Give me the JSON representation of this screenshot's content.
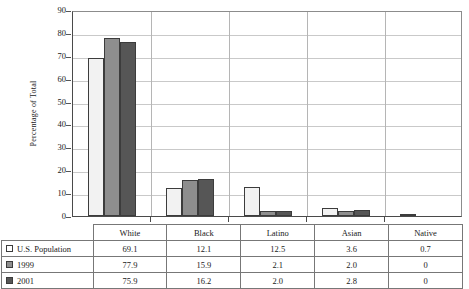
{
  "chart_data": {
    "type": "bar",
    "title": "",
    "xlabel": "",
    "ylabel": "Percentage of Total",
    "ylim": [
      0,
      90
    ],
    "ytick_step": 10,
    "yticks": [
      90,
      80,
      70,
      60,
      50,
      40,
      30,
      20,
      10,
      0
    ],
    "grid": true,
    "legend_position": "table-left-column",
    "categories": [
      "White",
      "Black",
      "Latino",
      "Asian",
      "Native"
    ],
    "series": [
      {
        "name": "U.S. Population",
        "swatch": "s0",
        "color": "#f2f2f2",
        "values": [
          69.1,
          12.1,
          12.5,
          3.6,
          0.7
        ],
        "labels": [
          "69.1",
          "12.1",
          "12.5",
          "3.6",
          "0.7"
        ]
      },
      {
        "name": "1999",
        "swatch": "s1",
        "color": "#8e8e8e",
        "values": [
          77.9,
          15.9,
          2.1,
          2.0,
          0
        ],
        "labels": [
          "77.9",
          "15.9",
          "2.1",
          "2.0",
          "0"
        ]
      },
      {
        "name": "2001",
        "swatch": "s2",
        "color": "#565656",
        "values": [
          75.9,
          16.2,
          2.0,
          2.8,
          0
        ],
        "labels": [
          "75.9",
          "16.2",
          "2.0",
          "2.8",
          "0"
        ]
      }
    ]
  },
  "colors": {
    "series_us_population": "#f2f2f2",
    "series_1999": "#8e8e8e",
    "series_2001": "#565656",
    "bar_outline": "#3c3c3c",
    "gridline": "#c9c9c9",
    "axis": "#4a4a4a",
    "table_border": "#777777",
    "background": "#ffffff"
  },
  "axis": {
    "y_title": "Percentage of Total",
    "y_ticks": [
      "90",
      "80",
      "70",
      "60",
      "50",
      "40",
      "30",
      "20",
      "10",
      "0"
    ]
  },
  "table": {
    "corner_label": "",
    "column_headers": [
      "White",
      "Black",
      "Latino",
      "Asian",
      "Native"
    ],
    "rows": [
      {
        "legend": "U.S. Population",
        "swatch": "s0",
        "cells": [
          "69.1",
          "12.1",
          "12.5",
          "3.6",
          "0.7"
        ]
      },
      {
        "legend": "1999",
        "swatch": "s1",
        "cells": [
          "77.9",
          "15.9",
          "2.1",
          "2.0",
          "0"
        ]
      },
      {
        "legend": "2001",
        "swatch": "s2",
        "cells": [
          "75.9",
          "16.2",
          "2.0",
          "2.8",
          "0"
        ]
      }
    ]
  }
}
